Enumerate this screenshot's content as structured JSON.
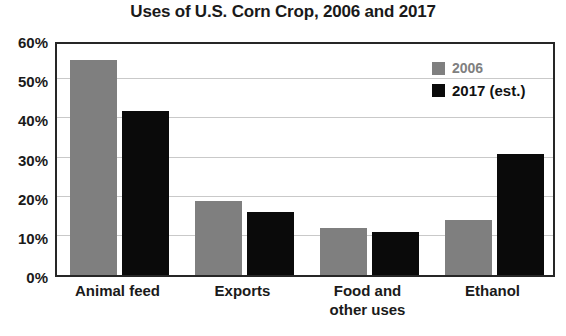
{
  "chart_data": {
    "type": "bar",
    "title": "Uses of U.S. Corn Crop, 2006 and 2017",
    "xlabel": "",
    "ylabel": "",
    "categories": [
      "Animal feed",
      "Exports",
      "Food and\nother uses",
      "Ethanol"
    ],
    "series": [
      {
        "name": "2006",
        "values": [
          55,
          19,
          12,
          14
        ],
        "color": "#7f7f7f"
      },
      {
        "name": "2017 (est.)",
        "values": [
          42,
          16,
          11,
          31
        ],
        "color": "#0a0a0a"
      }
    ],
    "ylim": [
      0,
      60
    ],
    "ytick_values": [
      0,
      10,
      20,
      30,
      40,
      50,
      60
    ],
    "ytick_labels": [
      "0%",
      "10%",
      "20%",
      "30%",
      "40%",
      "50%",
      "60%"
    ],
    "grid": true,
    "grid_axis": "y",
    "legend_position": "top-right",
    "value_format": "percent"
  },
  "legend": {
    "entries": [
      {
        "label": "2006",
        "swatch": "legend-swatch-2006"
      },
      {
        "label": "2017 (est.)",
        "swatch": "legend-swatch-2017"
      }
    ]
  }
}
